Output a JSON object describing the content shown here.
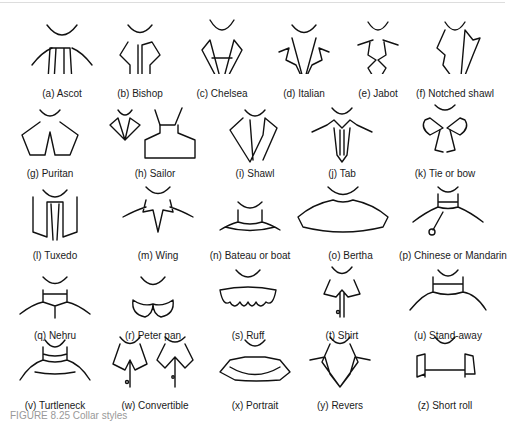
{
  "figure": {
    "caption": "FIGURE 8.25  Collar styles",
    "collars": [
      {
        "id": "a",
        "label": "(a)  Ascot"
      },
      {
        "id": "b",
        "label": "(b)  Bishop"
      },
      {
        "id": "c",
        "label": "(c)  Chelsea"
      },
      {
        "id": "d",
        "label": "(d)  Italian"
      },
      {
        "id": "e",
        "label": "(e)  Jabot"
      },
      {
        "id": "f",
        "label": "(f)  Notched shawl"
      },
      {
        "id": "g",
        "label": "(g)  Puritan"
      },
      {
        "id": "h",
        "label": "(h)  Sailor"
      },
      {
        "id": "i",
        "label": "(i)  Shawl"
      },
      {
        "id": "j",
        "label": "(j)  Tab"
      },
      {
        "id": "k",
        "label": "(k)  Tie or bow"
      },
      {
        "id": "l",
        "label": "(l)  Tuxedo"
      },
      {
        "id": "m",
        "label": "(m) Wing"
      },
      {
        "id": "n",
        "label": "(n)  Bateau or boat"
      },
      {
        "id": "o",
        "label": "(o)  Bertha"
      },
      {
        "id": "p",
        "label": "(p)  Chinese or Mandarin"
      },
      {
        "id": "q",
        "label": "(q)  Nehru"
      },
      {
        "id": "r",
        "label": "(r)  Peter pan"
      },
      {
        "id": "s",
        "label": "(s)  Ruff"
      },
      {
        "id": "t",
        "label": "(t)  Shirt"
      },
      {
        "id": "u",
        "label": "(u)  Stand-away"
      },
      {
        "id": "v",
        "label": "(v)  Turtleneck"
      },
      {
        "id": "w",
        "label": "(w) Convertible"
      },
      {
        "id": "x",
        "label": "(x)  Portrait"
      },
      {
        "id": "y",
        "label": "(y)  Revers"
      },
      {
        "id": "z",
        "label": "(z)  Short roll"
      }
    ]
  }
}
